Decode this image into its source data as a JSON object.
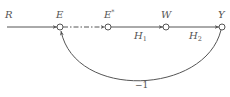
{
  "diagram": {
    "type": "signal-flow-graph",
    "nodes": [
      {
        "id": "R",
        "label": "R"
      },
      {
        "id": "E",
        "label": "E"
      },
      {
        "id": "Estar",
        "label": "E",
        "sup": "*"
      },
      {
        "id": "W",
        "label": "W"
      },
      {
        "id": "Y",
        "label": "Y"
      }
    ],
    "edges": [
      {
        "from": "R",
        "to": "E",
        "gain": "",
        "style": "solid"
      },
      {
        "from": "E",
        "to": "Estar",
        "gain": "",
        "style": "dash-dot"
      },
      {
        "from": "Estar",
        "to": "W",
        "gain": "H",
        "gain_sub": "1",
        "style": "solid"
      },
      {
        "from": "W",
        "to": "Y",
        "gain": "H",
        "gain_sub": "2",
        "style": "solid"
      },
      {
        "from": "Y",
        "to": "E",
        "gain": "−1",
        "style": "curved-feedback"
      }
    ],
    "colors": {
      "line": "#555555",
      "text": "#555555",
      "background": "#ffffff"
    }
  }
}
